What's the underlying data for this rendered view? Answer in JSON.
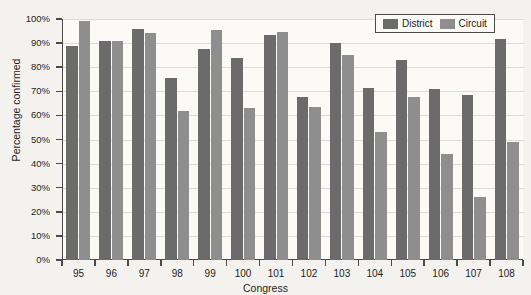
{
  "chart_data": {
    "type": "bar",
    "title": "",
    "xlabel": "Congress",
    "ylabel": "Percentage confirmed",
    "categories": [
      "95",
      "96",
      "97",
      "98",
      "99",
      "100",
      "101",
      "102",
      "103",
      "104",
      "105",
      "106",
      "107",
      "108"
    ],
    "series": [
      {
        "name": "District",
        "color": "#6b6b6b",
        "values": [
          89,
          91,
          96,
          75.5,
          87.5,
          84,
          93.5,
          67.5,
          90,
          71.5,
          83,
          71,
          68.5,
          91.5
        ]
      },
      {
        "name": "Circuit",
        "color": "#8e8e8e",
        "values": [
          99,
          91,
          94,
          62,
          95.5,
          63,
          94.5,
          63.5,
          85,
          53,
          67.5,
          44,
          26,
          49
        ]
      }
    ],
    "ylim": [
      0,
      100
    ],
    "ytick_labels": [
      "0%",
      "10%",
      "20%",
      "30%",
      "40%",
      "50%",
      "60%",
      "70%",
      "80%",
      "90%",
      "100%"
    ],
    "ytick_values": [
      0,
      10,
      20,
      30,
      40,
      50,
      60,
      70,
      80,
      90,
      100
    ],
    "grid": "horizontal",
    "legend_position": "top-right"
  }
}
